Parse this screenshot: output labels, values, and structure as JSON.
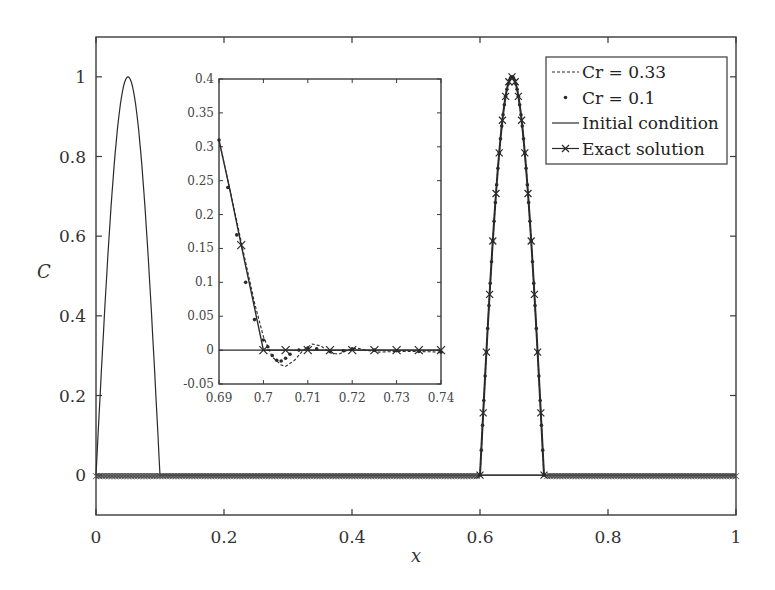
{
  "chart_data": [
    {
      "id": "main",
      "type": "line",
      "title": "",
      "xlabel": "x",
      "ylabel": "C",
      "xlim": [
        0,
        1
      ],
      "ylim": [
        -0.1,
        1.1
      ],
      "xticks": [
        0,
        0.2,
        0.4,
        0.6,
        0.8,
        1
      ],
      "xtick_labels": [
        "0",
        "0.2",
        "0.4",
        "0.6",
        "0.8",
        "1"
      ],
      "yticks": [
        0,
        0.2,
        0.4,
        0.6,
        0.8,
        1
      ],
      "ytick_labels": [
        "0",
        "0.2",
        "0.4",
        "0.6",
        "0.8",
        "1"
      ],
      "grid": false,
      "legend_position": "upper right",
      "series": [
        {
          "name": "Cr = 0.33",
          "style": "dashed",
          "description": "Numerical solution, pulse advected to x in [0.6, 0.7] peaking at C=1 near x=0.65",
          "x": [
            0,
            0.6,
            0.61,
            0.62,
            0.63,
            0.64,
            0.65,
            0.66,
            0.67,
            0.68,
            0.69,
            0.7,
            1.0
          ],
          "values": [
            0,
            0,
            0.31,
            0.59,
            0.81,
            0.95,
            1.0,
            0.95,
            0.81,
            0.59,
            0.31,
            0,
            0
          ]
        },
        {
          "name": "Cr = 0.1",
          "style": "dotted",
          "description": "Numerical solution with dense dots, coincides with exact solution",
          "x": [
            0,
            0.6,
            0.61,
            0.62,
            0.63,
            0.64,
            0.65,
            0.66,
            0.67,
            0.68,
            0.69,
            0.7,
            1.0
          ],
          "values": [
            0,
            0,
            0.31,
            0.59,
            0.81,
            0.95,
            1.0,
            0.95,
            0.81,
            0.59,
            0.31,
            0,
            0
          ]
        },
        {
          "name": "Initial condition",
          "style": "solid",
          "description": "Pulse on x in [0, 0.1] peaking at C=1 at x=0.05",
          "x": [
            0,
            0.01,
            0.02,
            0.03,
            0.04,
            0.05,
            0.06,
            0.07,
            0.08,
            0.09,
            0.1,
            1.0
          ],
          "values": [
            0,
            0.31,
            0.59,
            0.81,
            0.95,
            1.0,
            0.95,
            0.81,
            0.59,
            0.31,
            0,
            0
          ]
        },
        {
          "name": "Exact solution",
          "style": "solid-x-markers",
          "description": "Pulse shifted to x in [0.6, 0.7] peaking at C=1 at x=0.65",
          "x": [
            0,
            0.6,
            0.61,
            0.62,
            0.63,
            0.64,
            0.65,
            0.66,
            0.67,
            0.68,
            0.69,
            0.7,
            1.0
          ],
          "values": [
            0,
            0,
            0.31,
            0.59,
            0.81,
            0.95,
            1.0,
            0.95,
            0.81,
            0.59,
            0.31,
            0,
            0
          ]
        }
      ]
    },
    {
      "id": "inset",
      "type": "line",
      "title": "",
      "xlabel": "",
      "ylabel": "",
      "xlim": [
        0.69,
        0.74
      ],
      "ylim": [
        -0.05,
        0.4
      ],
      "xticks": [
        0.69,
        0.7,
        0.71,
        0.72,
        0.73,
        0.74
      ],
      "xtick_labels": [
        "0.69",
        "0.7",
        "0.71",
        "0.72",
        "0.73",
        "0.74"
      ],
      "yticks": [
        -0.05,
        0,
        0.05,
        0.1,
        0.15,
        0.2,
        0.25,
        0.3,
        0.35,
        0.4
      ],
      "ytick_labels": [
        "-0.05",
        "0",
        "0.05",
        "0.1",
        "0.15",
        "0.2",
        "0.25",
        "0.3",
        "0.35",
        "0.4"
      ],
      "grid": false,
      "series": [
        {
          "name": "Cr = 0.33",
          "style": "dashed",
          "x": [
            0.69,
            0.692,
            0.694,
            0.696,
            0.698,
            0.7,
            0.702,
            0.704,
            0.705,
            0.707,
            0.709,
            0.711,
            0.713,
            0.715,
            0.717,
            0.719,
            0.721,
            0.723,
            0.726,
            0.73,
            0.735,
            0.74
          ],
          "values": [
            0.31,
            0.25,
            0.19,
            0.13,
            0.07,
            0.02,
            -0.01,
            -0.022,
            -0.024,
            -0.015,
            0.0,
            0.009,
            0.006,
            -0.004,
            -0.006,
            0.0,
            0.003,
            0.0,
            -0.003,
            -0.002,
            -0.002,
            -0.003
          ]
        },
        {
          "name": "Cr = 0.1",
          "style": "dotted",
          "x": [
            0.69,
            0.692,
            0.694,
            0.696,
            0.698,
            0.7,
            0.701,
            0.702,
            0.703,
            0.704,
            0.705,
            0.706,
            0.708,
            0.71,
            0.712,
            0.715,
            0.718,
            0.72,
            0.725,
            0.73,
            0.735,
            0.74
          ],
          "values": [
            0.31,
            0.24,
            0.17,
            0.1,
            0.045,
            0.015,
            0.005,
            -0.008,
            -0.015,
            -0.016,
            -0.012,
            -0.006,
            0.0,
            0.003,
            0.002,
            -0.002,
            -0.001,
            0.002,
            0.0,
            -0.001,
            -0.002,
            -0.003
          ]
        },
        {
          "name": "Initial condition",
          "style": "solid",
          "x": [
            0.69,
            0.74
          ],
          "values": [
            0,
            0
          ]
        },
        {
          "name": "Exact solution",
          "style": "solid-x-markers",
          "x": [
            0.69,
            0.6925,
            0.695,
            0.6975,
            0.7,
            0.705,
            0.71,
            0.715,
            0.72,
            0.725,
            0.73,
            0.735,
            0.74
          ],
          "values": [
            0.31,
            0.235,
            0.155,
            0.078,
            0,
            0,
            0,
            0,
            0,
            0,
            0,
            0,
            0
          ],
          "markers_x": [
            0.695,
            0.7,
            0.705,
            0.71,
            0.715,
            0.72,
            0.725,
            0.73,
            0.735,
            0.74
          ]
        }
      ]
    }
  ],
  "legend": {
    "entries": [
      {
        "label": "Cr = 0.33",
        "style": "dashed"
      },
      {
        "label": "Cr = 0.1",
        "style": "dot"
      },
      {
        "label": "Initial condition",
        "style": "solid"
      },
      {
        "label": "Exact solution",
        "style": "solid-x"
      }
    ]
  },
  "colors": {
    "ink": "#2a2a2a",
    "frame": "#3a3a3a",
    "background": "#ffffff"
  }
}
